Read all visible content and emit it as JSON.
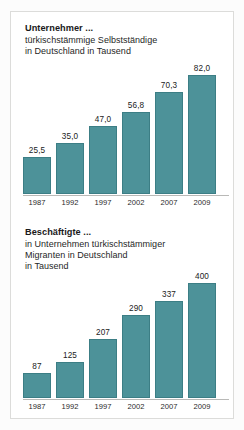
{
  "colors": {
    "bar_fill": "#4d9299",
    "bar_stroke": "#3c7e85",
    "panel_bg": "#ffffff",
    "page_bg": "#fcfcfc",
    "text": "#1a1a1a"
  },
  "charts": [
    {
      "title": "Unternehmer ...",
      "subtitle_lines": [
        "türkischstämmige Selbstständige",
        "in Deutschland in Tausend"
      ]
    },
    {
      "title": "Beschäftigte ...",
      "subtitle_lines": [
        "in Unternehmen türkischstämmiger",
        "Migranten in Deutschland",
        "in Tausend"
      ]
    }
  ],
  "chart_data": [
    {
      "type": "bar",
      "title": "Unternehmer ...",
      "subtitle": "türkischstämmige Selbstständige in Deutschland in Tausend",
      "xlabel": "",
      "ylabel": "Tausend",
      "categories": [
        "1987",
        "1992",
        "1997",
        "2002",
        "2007",
        "2009"
      ],
      "values": [
        25.5,
        35.0,
        47.0,
        56.8,
        70.3,
        82.0
      ],
      "value_labels": [
        "25,5",
        "35,0",
        "47,0",
        "56,8",
        "70,3",
        "82,0"
      ],
      "ylim": [
        0,
        82.0
      ],
      "grid": false,
      "legend": false
    },
    {
      "type": "bar",
      "title": "Beschäftigte ...",
      "subtitle": "in Unternehmen türkischstämmiger Migranten in Deutschland in Tausend",
      "xlabel": "",
      "ylabel": "Tausend",
      "categories": [
        "1987",
        "1992",
        "1997",
        "2002",
        "2007",
        "2009"
      ],
      "values": [
        87,
        125,
        207,
        290,
        337,
        400
      ],
      "value_labels": [
        "87",
        "125",
        "207",
        "290",
        "337",
        "400"
      ],
      "ylim": [
        0,
        400
      ],
      "grid": false,
      "legend": false
    }
  ]
}
